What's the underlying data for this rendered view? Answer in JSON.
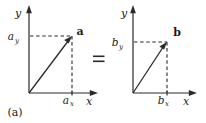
{
  "figure": {
    "caption": "(a)",
    "relation_symbol": "=",
    "panels": [
      {
        "id": "panel-a",
        "vector_label": "a",
        "x_axis_label": "x",
        "y_axis_label": "y",
        "x_component_base": "a",
        "x_component_sub": "x",
        "y_component_base": "a",
        "y_component_sub": "y",
        "origin": {
          "x": 29,
          "y": 93
        },
        "tip": {
          "x": 72,
          "y": 36
        }
      },
      {
        "id": "panel-b",
        "vector_label": "b",
        "x_axis_label": "x",
        "y_axis_label": "y",
        "x_component_base": "b",
        "x_component_sub": "x",
        "y_component_base": "b",
        "y_component_sub": "y",
        "origin": {
          "x": 133,
          "y": 93
        },
        "tip": {
          "x": 167,
          "y": 42
        }
      }
    ],
    "colors": {
      "ink": "#2b2b2b",
      "background": "#ffffff"
    }
  }
}
